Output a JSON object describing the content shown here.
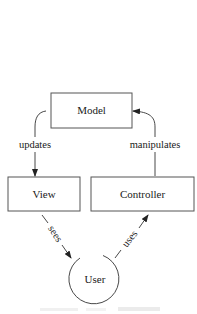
{
  "diagram": {
    "type": "MVC flow",
    "nodes": {
      "model": {
        "label": "Model",
        "shape": "rectangle"
      },
      "view": {
        "label": "View",
        "shape": "rectangle"
      },
      "controller": {
        "label": "Controller",
        "shape": "rectangle"
      },
      "user": {
        "label": "User",
        "shape": "circle"
      }
    },
    "edges": [
      {
        "from": "model",
        "to": "view",
        "label": "updates"
      },
      {
        "from": "controller",
        "to": "model",
        "label": "manipulates"
      },
      {
        "from": "view",
        "to": "user",
        "label": "sees"
      },
      {
        "from": "user",
        "to": "controller",
        "label": "uses"
      }
    ],
    "colors": {
      "stroke": "#333333",
      "text": "#1a1a1a",
      "background": "#ffffff"
    }
  }
}
